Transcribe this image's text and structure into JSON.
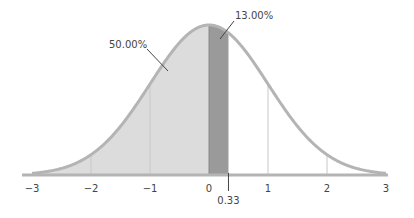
{
  "chart_data": {
    "type": "area",
    "title": "",
    "xlabel": "",
    "ylabel": "",
    "xlim": [
      -3,
      3
    ],
    "x_ticks": [
      "−3",
      "−2",
      "−1",
      "0",
      "1",
      "2",
      "3"
    ],
    "x_tick_values": [
      -3,
      -2,
      -1,
      0,
      1,
      2,
      3
    ],
    "grid": false,
    "legend": null,
    "distribution": {
      "mean": 0,
      "sd": 1
    },
    "regions": [
      {
        "name": "left-half",
        "from": -3,
        "to": 0,
        "area_label": "50.00%",
        "color": "#dcdcdc"
      },
      {
        "name": "band",
        "from": 0,
        "to": 0.33,
        "area_label": "13.00%",
        "color": "#9a9a9a"
      }
    ],
    "marker": {
      "x": 0.33,
      "label": "0.33"
    },
    "annotations": [
      {
        "text": "50.00%",
        "target_region": "left-half"
      },
      {
        "text": "13.00%",
        "target_region": "band"
      }
    ],
    "colors": {
      "curve": "#b4b4b4",
      "axis": "#b4b4b4",
      "gridline": "#c8c8c8",
      "text": "#444444"
    }
  }
}
